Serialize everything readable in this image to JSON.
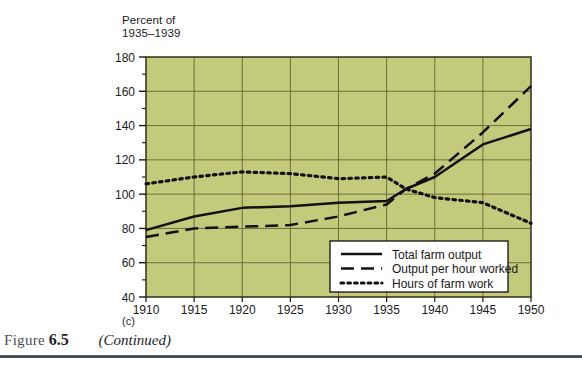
{
  "figure": {
    "caption_word": "Figure",
    "caption_number": "6.5",
    "caption_note": "(Continued)",
    "panel_letter": "(c)"
  },
  "colors": {
    "plot_background": "#c3ca7c",
    "gridline": "#6d6f38",
    "plot_border": "#3a3a20",
    "series_line": "#111111",
    "legend_background": "#ffffff",
    "legend_border": "#000000",
    "axis_text": "#1a1a1a",
    "caption_rule": "#3b4049"
  },
  "chart_data": {
    "type": "line",
    "title": "",
    "subtitle": "(c)",
    "ylabel": "Percent of\n1935–1939",
    "xlabel": "",
    "xlim": [
      1910,
      1950
    ],
    "ylim": [
      40,
      180
    ],
    "ytick_step": 20,
    "yminor_step": 10,
    "xtick_step": 5,
    "grid": true,
    "legend_position": "bottom-right",
    "xticks": [
      1910,
      1915,
      1920,
      1925,
      1930,
      1935,
      1940,
      1945,
      1950
    ],
    "yticks": [
      40,
      60,
      80,
      100,
      120,
      140,
      160,
      180
    ],
    "x": [
      1910,
      1915,
      1920,
      1925,
      1930,
      1935,
      1937,
      1940,
      1945,
      1950
    ],
    "series": [
      {
        "name": "Total farm output",
        "style": "solid",
        "values": [
          79,
          87,
          92,
          93,
          95,
          96,
          103,
          110,
          129,
          138
        ]
      },
      {
        "name": "Output per hour worked",
        "style": "dashed",
        "values": [
          75,
          80,
          81,
          82,
          87,
          94,
          103,
          112,
          136,
          163
        ]
      },
      {
        "name": "Hours of farm work",
        "style": "dotted",
        "values": [
          106,
          110,
          113,
          112,
          109,
          110,
          103,
          98,
          95,
          83
        ]
      }
    ]
  }
}
